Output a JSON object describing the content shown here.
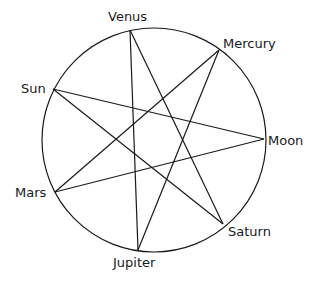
{
  "diagram": {
    "type": "heptagram",
    "circle": {
      "cx": 154,
      "cy": 140,
      "r": 112
    },
    "nodes": [
      {
        "id": "venus",
        "label": "Venus",
        "x": 130,
        "y": 30,
        "lx": 108,
        "ly": 21,
        "anchor": "start"
      },
      {
        "id": "mercury",
        "label": "Mercury",
        "x": 219,
        "y": 50,
        "lx": 223,
        "ly": 48,
        "anchor": "start"
      },
      {
        "id": "moon",
        "label": "Moon",
        "x": 264,
        "y": 139,
        "lx": 268,
        "ly": 145,
        "anchor": "start"
      },
      {
        "id": "saturn",
        "label": "Saturn",
        "x": 223,
        "y": 224,
        "lx": 228,
        "ly": 236,
        "anchor": "start"
      },
      {
        "id": "jupiter",
        "label": "Jupiter",
        "x": 138,
        "y": 250,
        "lx": 113,
        "ly": 267,
        "anchor": "start"
      },
      {
        "id": "mars",
        "label": "Mars",
        "x": 55,
        "y": 192,
        "lx": 15,
        "ly": 197,
        "anchor": "start"
      },
      {
        "id": "sun",
        "label": "Sun",
        "x": 53,
        "y": 89,
        "lx": 21,
        "ly": 93,
        "anchor": "start"
      }
    ],
    "edges": [
      [
        "venus",
        "saturn"
      ],
      [
        "venus",
        "jupiter"
      ],
      [
        "mercury",
        "mars"
      ],
      [
        "mercury",
        "jupiter"
      ],
      [
        "moon",
        "sun"
      ],
      [
        "moon",
        "mars"
      ],
      [
        "saturn",
        "sun"
      ]
    ]
  }
}
